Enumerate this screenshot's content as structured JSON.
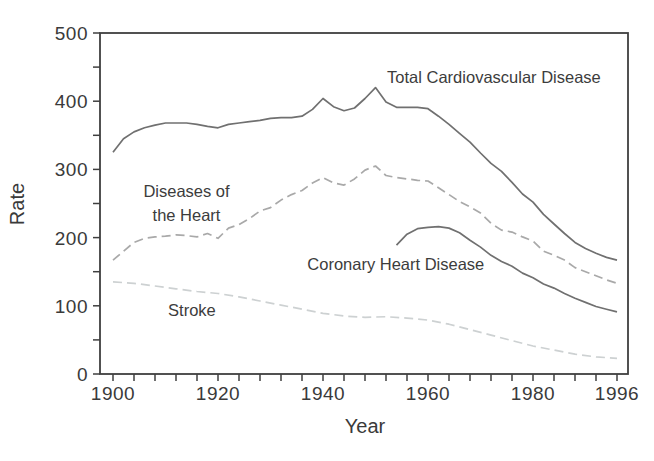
{
  "figure": {
    "background_color": "#ffffff",
    "axis_color": "#3f3f3f",
    "text_color": "#3a3a3a"
  },
  "chart_data": {
    "type": "line",
    "title": "",
    "xlabel": "Year",
    "ylabel": "Rate",
    "xlim": [
      1900,
      1996
    ],
    "ylim": [
      0,
      500
    ],
    "x_tick_step": 4,
    "y_tick_step": 50,
    "x_tick_labels": [
      1900,
      1920,
      1940,
      1960,
      1980,
      1996
    ],
    "y_tick_labels": [
      0,
      100,
      200,
      300,
      400,
      500
    ],
    "grid": false,
    "legend_position": "inline-annotations",
    "series": [
      {
        "name": "Total Cardiovascular Disease",
        "style": "solid",
        "color": "#707070",
        "points": [
          [
            1900,
            325
          ],
          [
            1902,
            345
          ],
          [
            1904,
            355
          ],
          [
            1906,
            361
          ],
          [
            1908,
            365
          ],
          [
            1910,
            368
          ],
          [
            1912,
            368
          ],
          [
            1914,
            368
          ],
          [
            1916,
            366
          ],
          [
            1918,
            363
          ],
          [
            1920,
            361
          ],
          [
            1922,
            366
          ],
          [
            1924,
            368
          ],
          [
            1926,
            370
          ],
          [
            1928,
            372
          ],
          [
            1930,
            375
          ],
          [
            1932,
            376
          ],
          [
            1934,
            376
          ],
          [
            1936,
            378
          ],
          [
            1938,
            388
          ],
          [
            1940,
            404
          ],
          [
            1942,
            392
          ],
          [
            1944,
            386
          ],
          [
            1946,
            390
          ],
          [
            1948,
            404
          ],
          [
            1950,
            420
          ],
          [
            1952,
            399
          ],
          [
            1954,
            391
          ],
          [
            1956,
            391
          ],
          [
            1958,
            391
          ],
          [
            1960,
            389
          ],
          [
            1962,
            378
          ],
          [
            1964,
            366
          ],
          [
            1966,
            353
          ],
          [
            1968,
            340
          ],
          [
            1970,
            324
          ],
          [
            1972,
            309
          ],
          [
            1974,
            297
          ],
          [
            1976,
            281
          ],
          [
            1978,
            264
          ],
          [
            1980,
            252
          ],
          [
            1982,
            234
          ],
          [
            1984,
            220
          ],
          [
            1986,
            206
          ],
          [
            1988,
            193
          ],
          [
            1990,
            184
          ],
          [
            1992,
            177
          ],
          [
            1994,
            171
          ],
          [
            1996,
            167
          ]
        ]
      },
      {
        "name": "Diseases of the Heart",
        "style": "dashed",
        "color": "#a9a9a9",
        "points": [
          [
            1900,
            167
          ],
          [
            1902,
            180
          ],
          [
            1904,
            193
          ],
          [
            1906,
            199
          ],
          [
            1908,
            201
          ],
          [
            1910,
            202
          ],
          [
            1912,
            204
          ],
          [
            1914,
            203
          ],
          [
            1916,
            201
          ],
          [
            1918,
            206
          ],
          [
            1920,
            199
          ],
          [
            1922,
            214
          ],
          [
            1924,
            219
          ],
          [
            1926,
            228
          ],
          [
            1928,
            239
          ],
          [
            1930,
            244
          ],
          [
            1932,
            255
          ],
          [
            1934,
            263
          ],
          [
            1936,
            269
          ],
          [
            1938,
            280
          ],
          [
            1940,
            288
          ],
          [
            1942,
            280
          ],
          [
            1944,
            277
          ],
          [
            1946,
            286
          ],
          [
            1948,
            299
          ],
          [
            1950,
            305
          ],
          [
            1952,
            291
          ],
          [
            1954,
            288
          ],
          [
            1956,
            286
          ],
          [
            1958,
            284
          ],
          [
            1960,
            283
          ],
          [
            1962,
            273
          ],
          [
            1964,
            263
          ],
          [
            1966,
            253
          ],
          [
            1968,
            245
          ],
          [
            1970,
            236
          ],
          [
            1972,
            221
          ],
          [
            1974,
            211
          ],
          [
            1976,
            208
          ],
          [
            1978,
            201
          ],
          [
            1980,
            195
          ],
          [
            1982,
            180
          ],
          [
            1984,
            174
          ],
          [
            1986,
            167
          ],
          [
            1988,
            156
          ],
          [
            1990,
            150
          ],
          [
            1992,
            144
          ],
          [
            1994,
            138
          ],
          [
            1996,
            133
          ]
        ]
      },
      {
        "name": "Coronary Heart Disease",
        "style": "solid",
        "color": "#707070",
        "points": [
          [
            1954,
            189
          ],
          [
            1956,
            205
          ],
          [
            1958,
            213
          ],
          [
            1960,
            215
          ],
          [
            1962,
            216
          ],
          [
            1964,
            214
          ],
          [
            1966,
            207
          ],
          [
            1968,
            196
          ],
          [
            1970,
            186
          ],
          [
            1972,
            174
          ],
          [
            1974,
            165
          ],
          [
            1976,
            158
          ],
          [
            1978,
            148
          ],
          [
            1980,
            141
          ],
          [
            1982,
            132
          ],
          [
            1984,
            126
          ],
          [
            1986,
            118
          ],
          [
            1988,
            111
          ],
          [
            1990,
            105
          ],
          [
            1992,
            99
          ],
          [
            1994,
            95
          ],
          [
            1996,
            91
          ]
        ]
      },
      {
        "name": "Stroke",
        "style": "dashed",
        "color": "#cdd1d2",
        "points": [
          [
            1900,
            135
          ],
          [
            1904,
            133
          ],
          [
            1908,
            129
          ],
          [
            1912,
            125
          ],
          [
            1916,
            121
          ],
          [
            1920,
            118
          ],
          [
            1924,
            113
          ],
          [
            1928,
            107
          ],
          [
            1932,
            101
          ],
          [
            1936,
            95
          ],
          [
            1940,
            89
          ],
          [
            1944,
            85
          ],
          [
            1948,
            83
          ],
          [
            1952,
            84
          ],
          [
            1956,
            82
          ],
          [
            1960,
            79
          ],
          [
            1964,
            73
          ],
          [
            1968,
            65
          ],
          [
            1972,
            57
          ],
          [
            1976,
            49
          ],
          [
            1980,
            41
          ],
          [
            1984,
            35
          ],
          [
            1988,
            29
          ],
          [
            1992,
            25
          ],
          [
            1996,
            23
          ]
        ]
      }
    ],
    "annotations": [
      {
        "text": "Total Cardiovascular Disease",
        "x": 1952.2,
        "y": 426.5,
        "anchor": "start"
      },
      {
        "text": "Diseases of",
        "x": 1914,
        "y": 259.5,
        "anchor": "middle"
      },
      {
        "text": "the Heart",
        "x": 1914,
        "y": 224,
        "anchor": "middle"
      },
      {
        "text": "Coronary Heart Disease",
        "x": 1937,
        "y": 152.5,
        "anchor": "start"
      },
      {
        "text": "Stroke",
        "x": 1910.5,
        "y": 85,
        "anchor": "start"
      }
    ]
  }
}
